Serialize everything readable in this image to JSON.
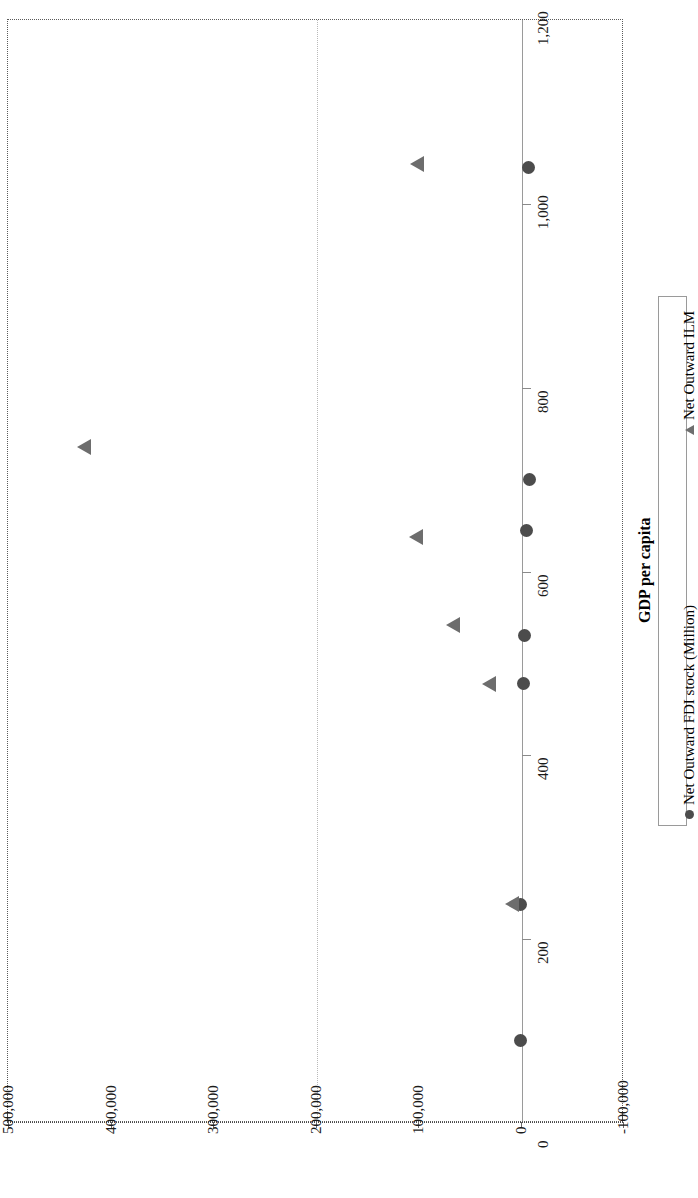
{
  "chart_data": {
    "type": "scatter",
    "title": "",
    "orientation": "rotated-90",
    "xlabel": "GDP per capita",
    "ylabel": "",
    "xlim": [
      0,
      1200
    ],
    "ylim": [
      -100000,
      500000
    ],
    "grid": true,
    "legend_position": "right",
    "x_ticks": [
      "0",
      "200",
      "400",
      "600",
      "800",
      "1,000",
      "1,200"
    ],
    "x_tick_values": [
      0,
      200,
      400,
      600,
      800,
      1000,
      1200
    ],
    "y_ticks": [
      "-100,000",
      "0",
      "100,000",
      "200,000",
      "300,000",
      "400,000",
      "500,000"
    ],
    "y_tick_values": [
      -100000,
      0,
      100000,
      200000,
      300000,
      400000,
      500000
    ],
    "series": [
      {
        "name": "Net Outward FDI stock (Million)",
        "marker": "circle",
        "color": "#4c4c4c",
        "points": [
          {
            "x": 1040,
            "y": -7000
          },
          {
            "x": 700,
            "y": -8000
          },
          {
            "x": 645,
            "y": -5000
          },
          {
            "x": 530,
            "y": -3000
          },
          {
            "x": 478,
            "y": -1500
          },
          {
            "x": 238,
            "y": 1000
          },
          {
            "x": 90,
            "y": 1000
          }
        ]
      },
      {
        "name": "Net Outward ILM",
        "marker": "triangle",
        "color": "#6e6e6e",
        "points": [
          {
            "x": 1043,
            "y": 95000
          },
          {
            "x": 735,
            "y": 420000
          },
          {
            "x": 638,
            "y": 96000
          },
          {
            "x": 542,
            "y": 60000
          },
          {
            "x": 478,
            "y": 25000
          },
          {
            "x": 238,
            "y": 2000
          }
        ]
      }
    ]
  },
  "axis_title": {
    "text": "GDP per capita"
  },
  "legend": {
    "entries": [
      {
        "label": "Net Outward FDI stock (Million)",
        "marker": "circle-marker-icon"
      },
      {
        "label": "Net Outward ILM",
        "marker": "triangle-marker-icon"
      }
    ]
  }
}
